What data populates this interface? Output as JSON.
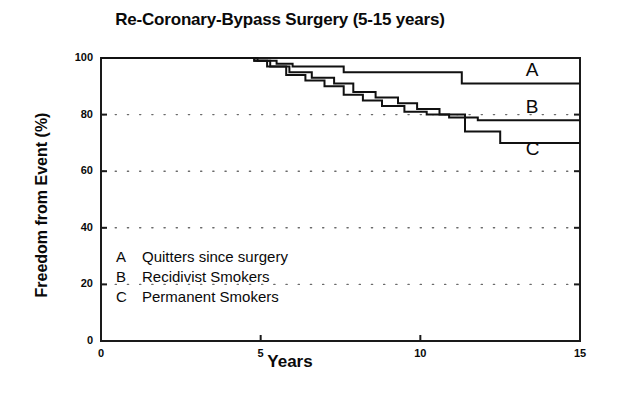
{
  "chart_data": {
    "type": "line",
    "title": "Re-Coronary-Bypass Surgery (5-15 years)",
    "xlabel": "Years",
    "ylabel": "Freedom from Event (%)",
    "xlim": [
      0,
      15
    ],
    "ylim": [
      0,
      100
    ],
    "xticks": [
      "0",
      "5",
      "10",
      "15"
    ],
    "xtick_values": [
      0,
      5,
      10,
      15
    ],
    "yticks": [
      "0",
      "20",
      "40",
      "60",
      "80",
      "100"
    ],
    "ytick_values": [
      0,
      20,
      40,
      60,
      80,
      100
    ],
    "grid": "dotted horizontal gridlines at 20, 40, 60, 80",
    "legend_position": "inside lower left",
    "curve_style": "stepped Kaplan-Meier survival curves",
    "series": [
      {
        "name": "A",
        "label": "Quitters since surgery",
        "end_label": "A",
        "points": [
          [
            0,
            100
          ],
          [
            4.9,
            100
          ],
          [
            4.9,
            99
          ],
          [
            5.5,
            99
          ],
          [
            5.5,
            98
          ],
          [
            6.0,
            98
          ],
          [
            6.0,
            97
          ],
          [
            7.6,
            97
          ],
          [
            7.6,
            95
          ],
          [
            11.3,
            95
          ],
          [
            11.3,
            91
          ],
          [
            15,
            91
          ]
        ]
      },
      {
        "name": "B",
        "label": "Recidivist Smokers",
        "end_label": "B",
        "points": [
          [
            0,
            100
          ],
          [
            4.8,
            100
          ],
          [
            4.8,
            99
          ],
          [
            5.3,
            99
          ],
          [
            5.3,
            97
          ],
          [
            5.9,
            97
          ],
          [
            5.9,
            95
          ],
          [
            6.6,
            95
          ],
          [
            6.6,
            93
          ],
          [
            7.3,
            93
          ],
          [
            7.3,
            91
          ],
          [
            7.9,
            91
          ],
          [
            7.9,
            88
          ],
          [
            8.6,
            88
          ],
          [
            8.6,
            86
          ],
          [
            9.3,
            86
          ],
          [
            9.3,
            84
          ],
          [
            9.9,
            84
          ],
          [
            9.9,
            82
          ],
          [
            10.6,
            82
          ],
          [
            10.6,
            80
          ],
          [
            11.4,
            80
          ],
          [
            11.4,
            79
          ],
          [
            11.8,
            79
          ],
          [
            11.8,
            78
          ],
          [
            15,
            78
          ]
        ]
      },
      {
        "name": "C",
        "label": "Permanent Smokers",
        "end_label": "C",
        "points": [
          [
            0,
            100
          ],
          [
            4.8,
            100
          ],
          [
            4.8,
            99
          ],
          [
            5.2,
            99
          ],
          [
            5.2,
            97
          ],
          [
            5.8,
            97
          ],
          [
            5.8,
            94
          ],
          [
            6.4,
            94
          ],
          [
            6.4,
            92
          ],
          [
            7.0,
            92
          ],
          [
            7.0,
            90
          ],
          [
            7.6,
            90
          ],
          [
            7.6,
            87
          ],
          [
            8.2,
            87
          ],
          [
            8.2,
            85
          ],
          [
            8.8,
            85
          ],
          [
            8.8,
            83
          ],
          [
            9.5,
            83
          ],
          [
            9.5,
            81
          ],
          [
            10.2,
            81
          ],
          [
            10.2,
            80
          ],
          [
            10.9,
            80
          ],
          [
            10.9,
            79
          ],
          [
            11.4,
            79
          ],
          [
            11.4,
            74
          ],
          [
            12.5,
            74
          ],
          [
            12.5,
            70
          ],
          [
            15,
            70
          ]
        ]
      }
    ],
    "annotations": [
      {
        "text": "A",
        "x": 13.3,
        "y": 95
      },
      {
        "text": "B",
        "x": 13.3,
        "y": 82
      },
      {
        "text": "C",
        "x": 13.3,
        "y": 67
      }
    ]
  },
  "legend": {
    "rows": [
      {
        "key": "A",
        "text": "Quitters since surgery"
      },
      {
        "key": "B",
        "text": "Recidivist Smokers"
      },
      {
        "key": "C",
        "text": "Permanent Smokers"
      }
    ]
  }
}
